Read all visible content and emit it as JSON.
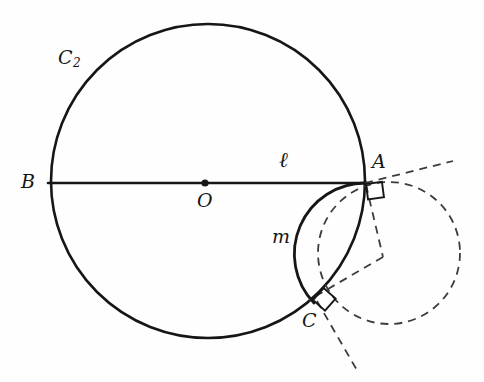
{
  "figure": {
    "background_color": "#fefefe",
    "stroke_color": "#161616",
    "dashed_color": "#3a3a3a",
    "width": 484,
    "height": 382
  },
  "labels": {
    "circle_c2": "C",
    "circle_c2_sub": "2",
    "point_b": "B",
    "point_o": "O",
    "point_a": "A",
    "point_c": "C",
    "line_l": "ℓ",
    "arc_m": "m"
  },
  "geometry": {
    "main_circle": {
      "cx": 208,
      "cy": 181,
      "r": 157,
      "name": "C2",
      "style": "solid"
    },
    "center_dot": {
      "cx": 205,
      "cy": 183,
      "r": 3.4
    },
    "diameter_line": {
      "x1": 48,
      "y1": 183,
      "x2": 366,
      "y2": 183,
      "name": "l"
    },
    "point_a": {
      "x": 366,
      "y": 183
    },
    "point_b": {
      "x": 50,
      "y": 183
    },
    "point_c": {
      "x": 314,
      "y": 303
    },
    "arc_m": {
      "from_x": 366,
      "from_y": 183,
      "to_x": 314,
      "to_y": 303,
      "rx": 71,
      "ry": 71,
      "sweep": 1,
      "large_arc": 0,
      "style": "solid"
    },
    "dashed_circle": {
      "cx": 389,
      "cy": 253,
      "r": 71,
      "style": "dashed"
    },
    "dashed_ray_a": {
      "x1": 366,
      "y1": 183,
      "x2": 452,
      "y2": 162
    },
    "dashed_radius_a": {
      "x1": 366,
      "y1": 183,
      "x2": 382,
      "y2": 256
    },
    "dashed_radius_c": {
      "x1": 382,
      "y1": 256,
      "x2": 310,
      "y2": 300
    },
    "dashed_ray_c": {
      "x1": 318,
      "y1": 300,
      "x2": 357,
      "y2": 371
    },
    "right_angle_a": {
      "x": 366,
      "y": 184,
      "size": 15,
      "rotation": -14
    },
    "right_angle_c": {
      "x": 313,
      "y": 300,
      "size": 15,
      "rotation": 32
    }
  },
  "label_positions": {
    "circle_c2": {
      "left": 58,
      "top": 48
    },
    "point_b": {
      "left": 21,
      "top": 172
    },
    "point_o": {
      "left": 197,
      "top": 191
    },
    "point_a": {
      "left": 372,
      "top": 153
    },
    "point_c": {
      "left": 303,
      "top": 311
    },
    "line_l": {
      "left": 277,
      "top": 152
    },
    "arc_m": {
      "left": 272,
      "top": 226
    }
  }
}
